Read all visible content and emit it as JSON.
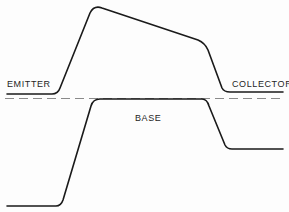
{
  "diagram": {
    "type": "band-diagram",
    "labels": {
      "emitter": "EMITTER",
      "collector": "COLLECTOR",
      "base": "BASE"
    },
    "colors": {
      "curve": "#1a1a1a",
      "dashed_reference": "#8a8a8a",
      "text": "#1e1e1e",
      "background": "#fdfdfd"
    },
    "curves": {
      "upper": "M7,94 L52,94 Q58,94 60,88 L90,13 Q94,5 102,8 L198,40 Q205,43 208,50 L222,88 Q224,92 230,92 L283,92",
      "lower": "M7,206 L56,206 Q61,206 63,200 L91,106 Q93,99 100,99 L202,99 Q207,99 209,106 L225,145 Q227,149 232,149 L283,149",
      "reference": "M5,98.5 L282,98.5"
    }
  }
}
